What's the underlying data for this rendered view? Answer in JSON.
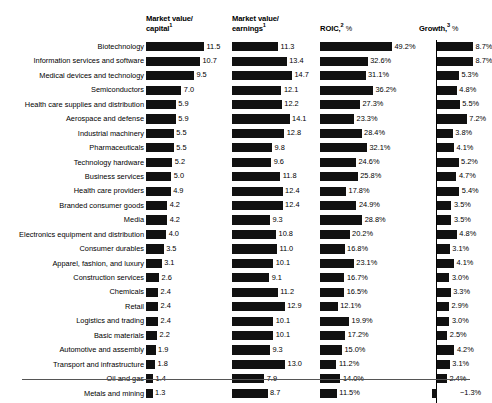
{
  "chart_data": {
    "type": "bar",
    "title": "",
    "subtitle": "",
    "xlabel": "",
    "ylabel": "",
    "grid": false,
    "legend_position": "none",
    "orientation": "horizontal",
    "categories": [
      "Biotechnology",
      "Information services and software",
      "Medical devices and technology",
      "Semiconductors",
      "Health care supplies and distribution",
      "Aerospace and defense",
      "Industrial machinery",
      "Pharmaceuticals",
      "Technology hardware",
      "Business services",
      "Health care providers",
      "Branded consumer goods",
      "Media",
      "Electronics equipment and distribution",
      "Consumer durables",
      "Apparel, fashion, and luxury",
      "Construction services",
      "Chemicals",
      "Retail",
      "Logistics and trading",
      "Basic materials",
      "Automotive and assembly",
      "Transport and infrastructure",
      "Oil and gas",
      "Metals and mining"
    ],
    "series": [
      {
        "name": "Market value/capital",
        "header_label": "Market value/",
        "header_label2": "capital",
        "footnote_marker": "1",
        "unit": "",
        "axis_max": 11.5,
        "labels": [
          "11.5",
          "10.7",
          "9.5",
          "7.0",
          "5.9",
          "5.9",
          "5.5",
          "5.5",
          "5.2",
          "5.0",
          "4.9",
          "4.2",
          "4.2",
          "4.0",
          "3.5",
          "3.1",
          "2.6",
          "2.4",
          "2.4",
          "2.4",
          "2.2",
          "1.9",
          "1.8",
          "1.4",
          "1.3"
        ],
        "values": [
          11.5,
          10.7,
          9.5,
          7.0,
          5.9,
          5.9,
          5.5,
          5.5,
          5.2,
          5.0,
          4.9,
          4.2,
          4.2,
          4.0,
          3.5,
          3.1,
          2.6,
          2.4,
          2.4,
          2.4,
          2.2,
          1.9,
          1.8,
          1.4,
          1.3
        ]
      },
      {
        "name": "Market value/earnings",
        "header_label": "Market value/",
        "header_label2": "earnings",
        "footnote_marker": "1",
        "unit": "",
        "axis_max": 14.7,
        "labels": [
          "11.3",
          "13.4",
          "14.7",
          "12.1",
          "12.2",
          "14.1",
          "12.8",
          "9.8",
          "9.6",
          "11.8",
          "12.4",
          "12.4",
          "9.3",
          "10.8",
          "11.0",
          "10.1",
          "9.1",
          "11.2",
          "12.9",
          "10.1",
          "10.1",
          "9.3",
          "13.0",
          "7.9",
          "8.7"
        ],
        "values": [
          11.3,
          13.4,
          14.7,
          12.1,
          12.2,
          14.1,
          12.8,
          9.8,
          9.6,
          11.8,
          12.4,
          12.4,
          9.3,
          10.8,
          11.0,
          10.1,
          9.1,
          11.2,
          12.9,
          10.1,
          10.1,
          9.3,
          13.0,
          7.9,
          8.7
        ]
      },
      {
        "name": "ROIC",
        "header_label": "ROIC,",
        "header_label2": "",
        "footnote_marker": "2",
        "unit": "%",
        "axis_max": 49.2,
        "labels": [
          "49.2%",
          "32.6%",
          "31.1%",
          "36.2%",
          "27.3%",
          "23.3%",
          "28.4%",
          "32.1%",
          "24.6%",
          "25.8%",
          "17.8%",
          "24.9%",
          "28.8%",
          "20.2%",
          "16.8%",
          "23.1%",
          "16.7%",
          "16.5%",
          "12.1%",
          "19.9%",
          "17.2%",
          "15.0%",
          "11.2%",
          "14.0%",
          "11.5%"
        ],
        "values": [
          49.2,
          32.6,
          31.1,
          36.2,
          27.3,
          23.3,
          28.4,
          32.1,
          24.6,
          25.8,
          17.8,
          24.9,
          28.8,
          20.2,
          16.8,
          23.1,
          16.7,
          16.5,
          12.1,
          19.9,
          17.2,
          15.0,
          11.2,
          14.0,
          11.5
        ]
      },
      {
        "name": "Growth",
        "header_label": "Growth,",
        "header_label2": "",
        "footnote_marker": "3",
        "unit": "%",
        "axis_max": 8.7,
        "labels": [
          "8.7%",
          "8.7%",
          "5.3%",
          "4.8%",
          "5.5%",
          "7.2%",
          "3.8%",
          "4.1%",
          "5.2%",
          "4.7%",
          "5.4%",
          "3.5%",
          "3.5%",
          "4.8%",
          "3.1%",
          "4.1%",
          "3.0%",
          "3.3%",
          "2.9%",
          "3.0%",
          "2.5%",
          "4.2%",
          "3.1%",
          "2.4%",
          "−1.3%"
        ],
        "values": [
          8.7,
          8.7,
          5.3,
          4.8,
          5.5,
          7.2,
          3.8,
          4.1,
          5.2,
          4.7,
          5.4,
          3.5,
          3.5,
          4.8,
          3.1,
          4.1,
          3.0,
          3.3,
          2.9,
          3.0,
          2.5,
          4.2,
          3.1,
          2.4,
          -1.3
        ]
      }
    ],
    "colors": {
      "bar": "#111111",
      "text": "#000000",
      "rule": "#555555",
      "background": "#ffffff"
    }
  }
}
